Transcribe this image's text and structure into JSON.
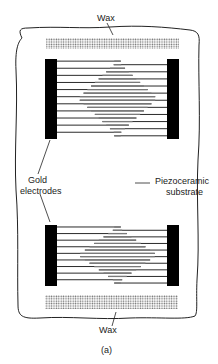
{
  "figure": {
    "caption": "(a)",
    "colors": {
      "outline": "#222222",
      "electrode": "#000000",
      "finger_dark": "#2a2a2a",
      "finger_grey": "#7a7a7a",
      "wax_dot": "#6a6a6a",
      "background": "#ffffff"
    }
  },
  "labels": {
    "wax_top": "Wax",
    "wax_bottom": "Wax",
    "gold_electrodes_line1": "Gold",
    "gold_electrodes_line2": "electrodes",
    "substrate_line1": "Piezoceramic",
    "substrate_line2": "substrate"
  },
  "transducers": [
    {
      "name": "top-transducer",
      "x": 45,
      "y": 59,
      "w": 134,
      "h": 80,
      "fingers": 22,
      "bar_w": 12
    },
    {
      "name": "bottom-transducer",
      "x": 45,
      "y": 225,
      "w": 134,
      "h": 61,
      "fingers": 18,
      "bar_w": 12
    }
  ],
  "wax_strips": [
    {
      "name": "wax-strip-top",
      "x": 46,
      "y": 38,
      "w": 133,
      "h": 11
    },
    {
      "name": "wax-strip-bottom",
      "x": 45,
      "y": 295,
      "w": 133,
      "h": 14
    }
  ]
}
